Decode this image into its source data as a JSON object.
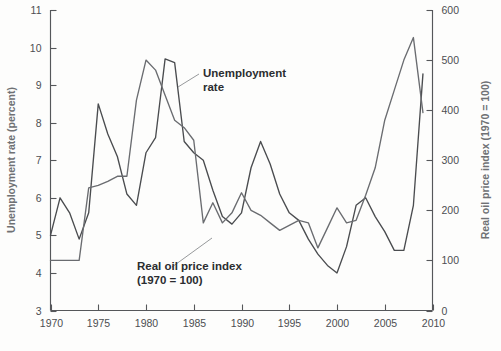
{
  "chart_data": {
    "type": "line",
    "title": "",
    "xlabel": "",
    "ylabel": "Unemployment rate (percent)",
    "y2label": "Real oil price index (1970 = 100)",
    "xlim": [
      1970,
      2010
    ],
    "ylim": [
      3,
      11
    ],
    "y2lim": [
      0,
      600
    ],
    "grid": false,
    "legend_position": "inline-annotations",
    "xticks": [
      1970,
      1975,
      1980,
      1985,
      1990,
      1995,
      2000,
      2005,
      2010
    ],
    "yticks": [
      3,
      4,
      5,
      6,
      7,
      8,
      9,
      10,
      11
    ],
    "y2ticks": [
      0,
      100,
      200,
      300,
      400,
      500,
      600
    ],
    "annotations": [
      {
        "text_line1": "Unemployment",
        "text_line2": "rate"
      },
      {
        "text_line1": "Real oil price index",
        "text_line2": "(1970 = 100)"
      }
    ],
    "x": [
      1970,
      1971,
      1972,
      1973,
      1974,
      1975,
      1976,
      1977,
      1978,
      1979,
      1980,
      1981,
      1982,
      1983,
      1984,
      1985,
      1986,
      1987,
      1988,
      1989,
      1990,
      1991,
      1992,
      1993,
      1994,
      1995,
      1996,
      1997,
      1998,
      1999,
      2000,
      2001,
      2002,
      2003,
      2004,
      2005,
      2006,
      2007,
      2008,
      2009
    ],
    "series": [
      {
        "name": "Unemployment rate",
        "axis": "left",
        "unit": "percent",
        "color": "#4a4c4f",
        "values": [
          5.0,
          6.0,
          5.6,
          4.9,
          5.6,
          8.5,
          7.7,
          7.1,
          6.1,
          5.8,
          7.2,
          7.6,
          9.7,
          9.6,
          7.5,
          7.2,
          7.0,
          6.2,
          5.5,
          5.3,
          5.6,
          6.8,
          7.5,
          6.9,
          6.1,
          5.6,
          5.4,
          4.9,
          4.5,
          4.2,
          4.0,
          4.7,
          5.8,
          6.0,
          5.5,
          5.1,
          4.6,
          4.6,
          5.8,
          9.3
        ]
      },
      {
        "name": "Real oil price index",
        "axis": "right",
        "unit": "index (1970 = 100)",
        "color": "#6a6c70",
        "values": [
          100,
          100,
          100,
          100,
          245,
          250,
          258,
          268,
          268,
          420,
          500,
          480,
          430,
          380,
          365,
          340,
          175,
          215,
          175,
          195,
          235,
          200,
          190,
          175,
          160,
          170,
          180,
          175,
          125,
          165,
          205,
          175,
          180,
          230,
          285,
          380,
          440,
          500,
          545,
          395
        ]
      }
    ]
  },
  "axes": {
    "left_title": "Unemployment rate (percent)",
    "right_title": "Real oil price index (1970 = 100)",
    "left_ticks": [
      "11",
      "10",
      "9",
      "8",
      "7",
      "6",
      "5",
      "4",
      "3"
    ],
    "right_ticks": [
      "600",
      "500",
      "400",
      "300",
      "200",
      "100",
      "0"
    ],
    "bottom_ticks": [
      "1970",
      "1975",
      "1980",
      "1985",
      "1990",
      "1995",
      "2000",
      "2005",
      "2010"
    ]
  },
  "labels": {
    "unemployment_l1": "Unemployment",
    "unemployment_l2": "rate",
    "oil_l1": "Real oil price index",
    "oil_l2": "(1970 = 100)"
  },
  "colors": {
    "unemployment": "#4a4c4f",
    "oil": "#6a6c70",
    "axis": "#55575a",
    "text": "#4c4e51",
    "axis_title": "#6f7174"
  }
}
